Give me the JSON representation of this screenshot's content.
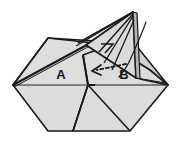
{
  "figure": {
    "type": "origami-fold-diagram",
    "background_color": "#ffffff",
    "outline_color": "#1a1a1a",
    "fill_light": "#e3e3e3",
    "fill_mid": "#d6d6d6",
    "fill_dark": "#c4c4c4",
    "crease_color": "#9a9a9a",
    "arrow_color": "#1a1a1a"
  },
  "labels": [
    {
      "id": "panel-a",
      "text": "A",
      "x": 61,
      "y": 76
    },
    {
      "id": "panel-b",
      "text": "B",
      "x": 124,
      "y": 76
    }
  ],
  "annotations": {
    "fold_arrow": {
      "name": "dashed-fold-arrow",
      "style": "dashed",
      "direction": "left",
      "from_x": 126,
      "from_y": 64,
      "to_x": 93,
      "to_y": 72
    },
    "curve_line": {
      "name": "flap-motion-curve",
      "description": "thin curved line at upper right indicating raised flap edge"
    }
  },
  "geometry": {
    "body_outline": "13,85 48,38 130,38 168,85 130,132 48,132",
    "left_vertex": {
      "x": 13,
      "y": 85
    },
    "right_vertex": {
      "x": 168,
      "y": 85
    },
    "apex": {
      "x": 133,
      "y": 12
    }
  }
}
